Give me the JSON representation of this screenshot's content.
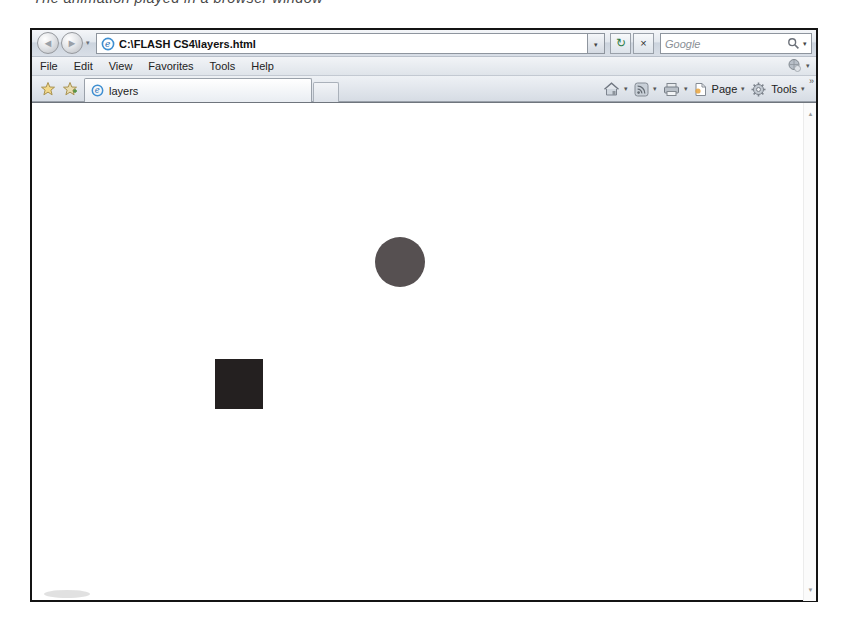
{
  "caption": "The animation played in a browser window",
  "browser": {
    "navbar": {
      "url": "C:\\FLASH CS4\\layers.html",
      "search_placeholder": "Google"
    },
    "menu": {
      "items": [
        "File",
        "Edit",
        "View",
        "Favorites",
        "Tools",
        "Help"
      ]
    },
    "tabbar": {
      "active_tab_label": "layers",
      "page_label": "Page",
      "tools_label": "Tools"
    }
  },
  "icons": {
    "dropdown": "▾",
    "back_arrow": "◄",
    "forward_arrow": "►",
    "refresh": "↻",
    "stop": "×",
    "chevron_overflow": "»",
    "scroll_up": "▲",
    "scroll_down": "▼"
  },
  "content": {
    "shapes": [
      {
        "type": "circle",
        "name": "animation-circle",
        "color": "#565051"
      },
      {
        "type": "square",
        "name": "animation-square",
        "color": "#242020"
      }
    ]
  }
}
